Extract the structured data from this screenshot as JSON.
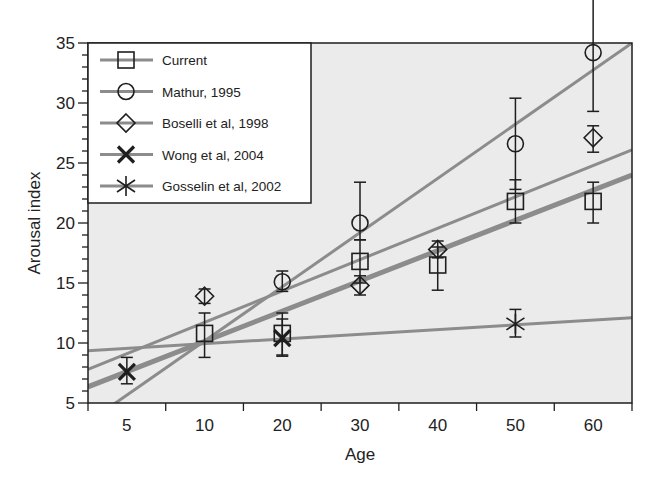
{
  "chart_data": {
    "type": "scatter",
    "title": "",
    "xlabel": "Age",
    "ylabel": "Arousal index",
    "categories": [
      "5",
      "10",
      "20",
      "30",
      "40",
      "50",
      "60"
    ],
    "ylim": [
      5,
      35
    ],
    "yticks": [
      5,
      10,
      15,
      20,
      25,
      30,
      35
    ],
    "grid": false,
    "legend_position": "upper-left",
    "series": [
      {
        "name": "Current",
        "marker": "square",
        "points": [
          {
            "x": "10",
            "y": 10.8,
            "err_low": 8.8,
            "err_high": 12.5
          },
          {
            "x": "20",
            "y": 10.8,
            "err_low": 9.0,
            "err_high": 12.5
          },
          {
            "x": "30",
            "y": 16.8,
            "err_low": 15.0,
            "err_high": 18.6
          },
          {
            "x": "40",
            "y": 16.5,
            "err_low": 14.4,
            "err_high": 18.0
          },
          {
            "x": "50",
            "y": 21.8,
            "err_low": 20.0,
            "err_high": 23.6
          },
          {
            "x": "60",
            "y": 21.8,
            "err_low": 20.0,
            "err_high": 23.4
          }
        ],
        "fit": {
          "y_left": 6.35,
          "y_right": 24.0,
          "thick": true
        }
      },
      {
        "name": "Mathur, 1995",
        "marker": "circle",
        "points": [
          {
            "x": "20",
            "y": 15.1,
            "err_low": 14.3,
            "err_high": 16.0
          },
          {
            "x": "30",
            "y": 20.0,
            "err_low": 18.6,
            "err_high": 23.4
          },
          {
            "x": "50",
            "y": 26.6,
            "err_low": 22.8,
            "err_high": 30.4
          },
          {
            "x": "60",
            "y": 34.2,
            "err_low": 29.3,
            "err_high": 38.7
          }
        ],
        "fit": {
          "y_left": 3.4,
          "y_right": 35.0,
          "thick": false
        }
      },
      {
        "name": "Boselli et al, 1998",
        "marker": "diamond",
        "points": [
          {
            "x": "10",
            "y": 13.9,
            "err_low": 13.3,
            "err_high": 14.5
          },
          {
            "x": "30",
            "y": 14.8,
            "err_low": 14.0,
            "err_high": 15.6
          },
          {
            "x": "40",
            "y": 17.8,
            "err_low": 17.1,
            "err_high": 18.5
          },
          {
            "x": "60",
            "y": 27.1,
            "err_low": 25.9,
            "err_high": 28.1
          }
        ],
        "fit": {
          "y_left": 7.8,
          "y_right": 26.1,
          "thick": false
        }
      },
      {
        "name": "Wong et al, 2004",
        "marker": "x",
        "points": [
          {
            "x": "5",
            "y": 7.6,
            "err_low": 6.6,
            "err_high": 8.8
          },
          {
            "x": "20",
            "y": 10.4,
            "err_low": 8.9,
            "err_high": 12.0
          }
        ],
        "fit": null
      },
      {
        "name": "Gosselin et al, 2002",
        "marker": "asterisk",
        "points": [
          {
            "x": "50",
            "y": 11.6,
            "err_low": 10.5,
            "err_high": 12.8
          }
        ],
        "fit": {
          "y_left": 9.35,
          "y_right": 12.1,
          "thick": false
        }
      }
    ]
  },
  "colors": {
    "plot_background": "#ebebeb",
    "legend_background": "#ffffff",
    "line_gray": "#8c8c8c",
    "marker": "#1e1e1e",
    "axis": "#1e1e1e"
  }
}
